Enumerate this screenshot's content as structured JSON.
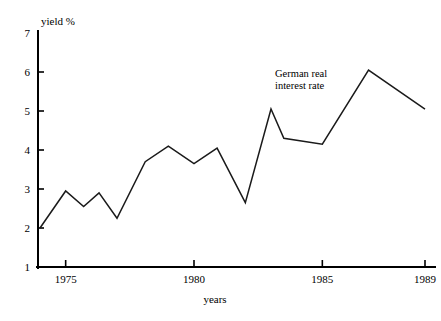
{
  "chart_data": {
    "type": "line",
    "title": "",
    "xlabel": "years",
    "ylabel": "yield %",
    "xlim": [
      1974,
      1989
    ],
    "ylim": [
      1,
      7
    ],
    "grid": false,
    "legend": "none",
    "annotations": [
      {
        "text_line_1": "German real",
        "text_line_2": "interest rate",
        "x": 1985.2,
        "y": 6.1
      }
    ],
    "y_ticks": [
      1,
      2,
      3,
      4,
      5,
      6,
      7
    ],
    "y_tick_labels": [
      "1",
      "2",
      "3",
      "4",
      "5",
      "6",
      "7"
    ],
    "x_ticks": [
      1975,
      1980,
      1985,
      1989
    ],
    "x_tick_labels": [
      "1975",
      "1980",
      "1985",
      "1989"
    ],
    "series": [
      {
        "name": "German real interest rate",
        "color": "#1a1a1a",
        "x": [
          1974.0,
          1975.0,
          1975.7,
          1976.3,
          1977.0,
          1978.1,
          1979.0,
          1980.0,
          1980.9,
          1982.0,
          1983.0,
          1983.5,
          1985.0,
          1986.8,
          1989.0
        ],
        "values": [
          2.0,
          2.95,
          2.55,
          2.9,
          2.25,
          3.7,
          4.1,
          3.65,
          4.05,
          2.65,
          5.05,
          4.3,
          4.15,
          6.05,
          5.05
        ]
      }
    ]
  },
  "labels": {
    "y_axis_title": "yield %",
    "x_axis_title": "years"
  }
}
